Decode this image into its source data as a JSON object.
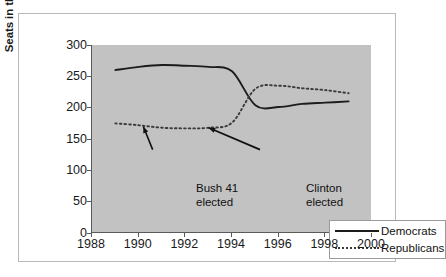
{
  "chart_data": {
    "type": "line",
    "title": "",
    "xlabel": "",
    "ylabel": "Seats in the House of Rep.",
    "xlim": [
      1988,
      2000
    ],
    "ylim": [
      0,
      300
    ],
    "xticks": [
      1988,
      1990,
      1992,
      1994,
      1996,
      1998,
      2000
    ],
    "yticks": [
      0,
      50,
      100,
      150,
      200,
      250,
      300
    ],
    "grid": false,
    "legend_position": "lower right",
    "x": [
      1989,
      1990,
      1991,
      1992,
      1993,
      1994,
      1995,
      1996,
      1997,
      1998,
      1999
    ],
    "series": [
      {
        "name": "Democrats",
        "style": "solid",
        "color": "#1c1c1c",
        "values": [
          260,
          265,
          268,
          267,
          265,
          258,
          204,
          201,
          206,
          208,
          210
        ]
      },
      {
        "name": "Republicans",
        "style": "dotted",
        "color": "#3a3a3a",
        "values": [
          175,
          172,
          168,
          167,
          168,
          176,
          230,
          235,
          231,
          228,
          223
        ]
      }
    ],
    "annotations": [
      {
        "text": "Bush 41\nelected",
        "target_x": 1990.2,
        "target_y": 170,
        "label_x": 1990.6,
        "label_y": 125
      },
      {
        "text": "Clinton elected",
        "target_x": 1993.0,
        "target_y": 168,
        "label_x": 1995.2,
        "label_y": 125
      }
    ]
  },
  "axes": {
    "y_title": "Seats in the House of Rep.",
    "y_tick_labels": [
      "300",
      "250",
      "200",
      "150",
      "100",
      "50",
      "0"
    ],
    "x_tick_labels": [
      "1988",
      "1990",
      "1992",
      "1994",
      "1996",
      "1998",
      "2000"
    ]
  },
  "annotations": {
    "bush": "Bush 41\nelected",
    "clinton": "Clinton elected"
  },
  "legend": {
    "entries": [
      {
        "label": "Democrats",
        "style": "solid"
      },
      {
        "label": "Republicans",
        "style": "dotted"
      }
    ]
  },
  "colors": {
    "plot_background": "#c2c2c2",
    "figure_background": "#ffffff",
    "frame_border": "#b9b9b9",
    "axis_line": "#5a5a5a",
    "democrats_line": "#1c1c1c",
    "republicans_line": "#3a3a3a",
    "text": "#111111"
  }
}
